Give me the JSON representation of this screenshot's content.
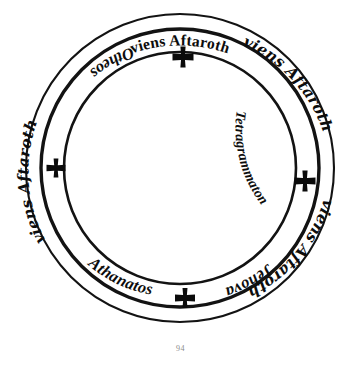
{
  "page": {
    "number": "94",
    "background_color": "#ffffff",
    "ink_color": "#0d0d0d"
  },
  "figure": {
    "name": "magic-circle",
    "center": {
      "x": 180,
      "y": 168
    },
    "rings": [
      {
        "name": "outer-ring",
        "radius": 154,
        "stroke_width": 2.1
      },
      {
        "name": "middle-ring",
        "radius": 139,
        "stroke_width": 3.4
      },
      {
        "name": "inner-ring",
        "radius": 116,
        "stroke_width": 2.6
      }
    ],
    "outer_band": {
      "name": "outer-band",
      "inscriptions": [
        {
          "id": "outer-top",
          "text": "viens Aftaroth",
          "reading": "viens Astaroth",
          "position": "top",
          "orientation": "upright"
        },
        {
          "id": "outer-upper-right",
          "text": "viens Aftaroth",
          "reading": "viens Astaroth",
          "position": "upper-right",
          "orientation": "upright"
        },
        {
          "id": "outer-lower-right",
          "text": "viens Aftaroth",
          "reading": "viens Astaroth",
          "position": "lower-right",
          "orientation": "upright"
        },
        {
          "id": "outer-left",
          "text": "viens Aftaroth",
          "reading": "viens Astaroth",
          "position": "left",
          "orientation": "upright"
        }
      ]
    },
    "inner_band": {
      "name": "inner-band",
      "inscriptions": [
        {
          "id": "inner-upper-left",
          "text": "Otheos",
          "position": "upper-left",
          "orientation": "inverted"
        },
        {
          "id": "inner-right",
          "text": "Tetragrammaton",
          "position": "right",
          "orientation": "inverted"
        },
        {
          "id": "inner-lower-right",
          "text": "Jehova",
          "position": "lower-right",
          "orientation": "upright"
        },
        {
          "id": "inner-lower-left",
          "text": "Athanatos",
          "position": "lower-left",
          "orientation": "upright"
        }
      ]
    },
    "crosses": [
      {
        "id": "cross-top",
        "symbol": "cross",
        "x": 183,
        "y": 57,
        "size": 21
      },
      {
        "id": "cross-right",
        "symbol": "cross",
        "x": 305,
        "y": 181,
        "size": 21
      },
      {
        "id": "cross-bottom",
        "symbol": "cross",
        "x": 185,
        "y": 298,
        "size": 20
      },
      {
        "id": "cross-left",
        "symbol": "cross",
        "x": 56,
        "y": 168,
        "size": 19
      }
    ]
  }
}
